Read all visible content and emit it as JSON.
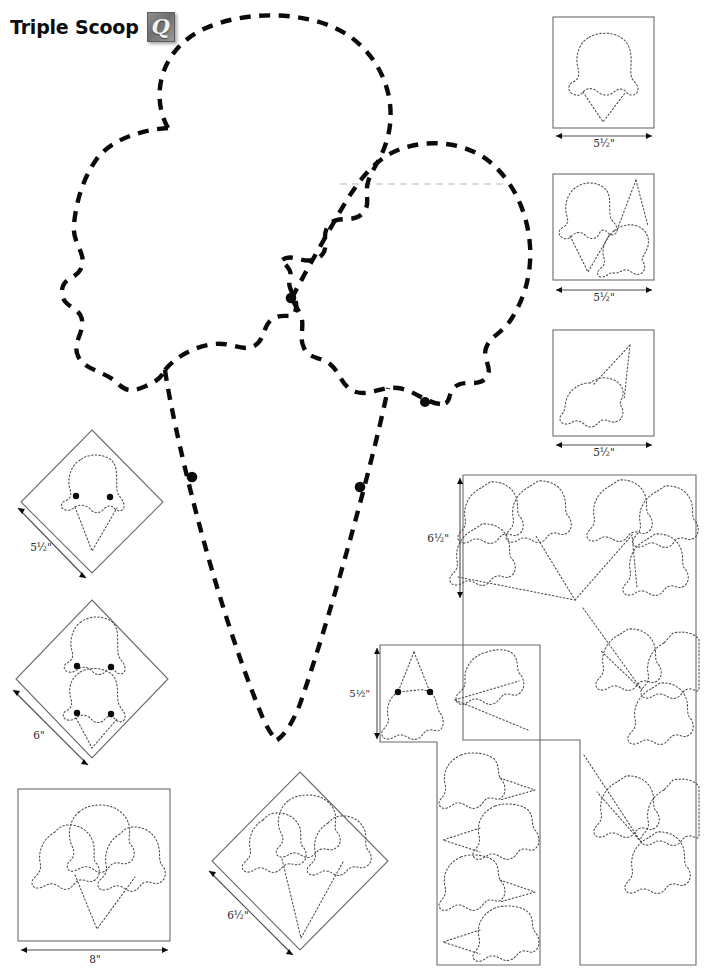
{
  "page": {
    "title": "Triple Scoop",
    "logo_icon": "script-q-logo-icon",
    "logo_letter": "Q",
    "width_px": 709,
    "height_px": 975,
    "background": "#ffffff",
    "line_color": "#0b0b0b",
    "box_color": "#6b6b6b",
    "ghost_color": "#cfcfcf"
  },
  "main_template": {
    "name": "triple-scoop-master-outline",
    "description": "Large dashed master applique outline of a triple scoop ice cream cone",
    "style": "heavy-dashed",
    "registration_dots": 4
  },
  "panels": [
    {
      "id": "panel-single-scoop-square",
      "shape": "square",
      "contents": "single-scoop-cone",
      "dimension": "5½\"",
      "dimension_axis": "horizontal"
    },
    {
      "id": "panel-scoop-pair-square",
      "shape": "square",
      "contents": "cone-with-scoop-plus-scoop",
      "dimension": "5½\"",
      "dimension_axis": "horizontal"
    },
    {
      "id": "panel-tilted-cone-square",
      "shape": "square",
      "contents": "tilted-single-scoop-cone",
      "dimension": "5½\"",
      "dimension_axis": "horizontal"
    },
    {
      "id": "panel-single-scoop-diamond",
      "shape": "diamond",
      "contents": "single-scoop-cone",
      "dimension": "5½\"",
      "dimension_axis": "diagonal"
    },
    {
      "id": "panel-double-scoop-diamond",
      "shape": "diamond",
      "contents": "double-scoop-cone",
      "dimension": "6\"",
      "dimension_axis": "diagonal"
    },
    {
      "id": "panel-triple-scoop-square",
      "shape": "square",
      "contents": "triple-scoop-cone",
      "dimension": "8\"",
      "dimension_axis": "horizontal"
    },
    {
      "id": "panel-triple-scoop-diamond",
      "shape": "diamond",
      "contents": "triple-scoop-cone",
      "dimension": "6½\"",
      "dimension_axis": "diagonal"
    },
    {
      "id": "panel-rotated-cones-small",
      "shape": "rectangle",
      "contents": "rotated-single-scoop-cones",
      "dimension": "5½\"",
      "dimension_axis": "vertical"
    },
    {
      "id": "panel-rotated-triple-scoops-large",
      "shape": "rectangle",
      "contents": "rotated-triple-scoop-cones-radial",
      "dimension": "6½\"",
      "dimension_axis": "vertical"
    }
  ],
  "dimension_labels": [
    {
      "key": "d1",
      "text": "5½\""
    },
    {
      "key": "d2",
      "text": "5½\""
    },
    {
      "key": "d3",
      "text": "5½\""
    },
    {
      "key": "d4",
      "text": "5½\""
    },
    {
      "key": "d5",
      "text": "6\""
    },
    {
      "key": "d6",
      "text": "8\""
    },
    {
      "key": "d7",
      "text": "6½\""
    },
    {
      "key": "d8",
      "text": "5½\""
    },
    {
      "key": "d9",
      "text": "6½\""
    }
  ]
}
